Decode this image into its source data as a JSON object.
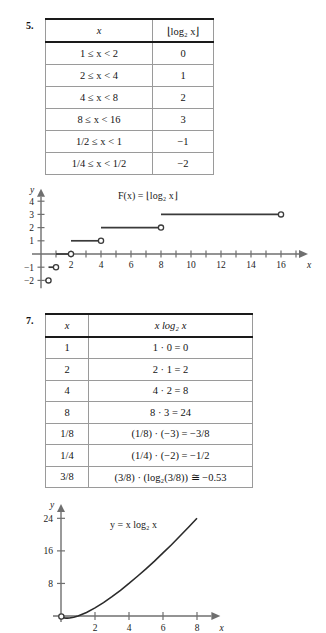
{
  "page": {
    "background": "#ffffff",
    "ink": "#1a1a1a"
  },
  "exercise5": {
    "number": "5.",
    "table": {
      "headers": [
        "x",
        "⌊log₂ x⌋"
      ],
      "rows": [
        [
          "1 ≤ x < 2",
          "0"
        ],
        [
          "2 ≤ x < 4",
          "1"
        ],
        [
          "4 ≤ x < 8",
          "2"
        ],
        [
          "8 ≤ x < 16",
          "3"
        ],
        [
          "1/2 ≤ x < 1",
          "−1"
        ],
        [
          "1/4 ≤ x < 1/2",
          "−2"
        ]
      ]
    },
    "chart_data": {
      "type": "line",
      "title": "",
      "annotation": "F(x) = ⌊log₂ x⌋",
      "xlabel": "x",
      "ylabel": "y",
      "xlim": [
        -0.6,
        17.6
      ],
      "ylim": [
        -2.6,
        4.8
      ],
      "xticks": [
        1,
        2,
        3,
        4,
        5,
        6,
        7,
        8,
        9,
        10,
        11,
        12,
        13,
        14,
        15,
        16,
        17
      ],
      "xtick_labels": [
        {
          "x": 2,
          "label": "2"
        },
        {
          "x": 4,
          "label": "4"
        },
        {
          "x": 6,
          "label": "6"
        },
        {
          "x": 8,
          "label": "8"
        },
        {
          "x": 10,
          "label": "10"
        },
        {
          "x": 12,
          "label": "12"
        },
        {
          "x": 14,
          "label": "14"
        },
        {
          "x": 16,
          "label": "16"
        }
      ],
      "yticks": [
        -2,
        -1,
        1,
        2,
        3,
        4
      ],
      "ytick_labels": [
        "−2",
        "−1",
        "1",
        "2",
        "3",
        "4"
      ],
      "grid": false,
      "legend": false,
      "steps": [
        {
          "x_start": 0.25,
          "x_end": 0.5,
          "y": -2,
          "open_right": true,
          "open_left": false
        },
        {
          "x_start": 0.5,
          "x_end": 1.0,
          "y": -1,
          "open_right": true,
          "open_left": false
        },
        {
          "x_start": 1.0,
          "x_end": 2.0,
          "y": 0,
          "open_right": true,
          "open_left": false
        },
        {
          "x_start": 2.0,
          "x_end": 4.0,
          "y": 1,
          "open_right": true,
          "open_left": false
        },
        {
          "x_start": 4.0,
          "x_end": 8.0,
          "y": 2,
          "open_right": true,
          "open_left": false
        },
        {
          "x_start": 8.0,
          "x_end": 16.0,
          "y": 3,
          "open_right": true,
          "open_left": false
        }
      ]
    }
  },
  "exercise7": {
    "number": "7.",
    "table": {
      "headers": [
        "x",
        "x log₂ x"
      ],
      "rows": [
        [
          "1",
          "1 · 0 = 0"
        ],
        [
          "2",
          "2 · 1 = 2"
        ],
        [
          "4",
          "4 · 2 = 8"
        ],
        [
          "8",
          "8 · 3 = 24"
        ],
        [
          "1/8",
          "(1/8) · (−3) = −3/8"
        ],
        [
          "1/4",
          "(1/4) · (−2) = −1/2"
        ],
        [
          "3/8",
          "(3/8) · (log₂(3/8)) ≅ −0.53"
        ]
      ]
    },
    "chart_data": {
      "type": "line",
      "title": "",
      "annotation": "y = x log₂ x",
      "xlabel": "x",
      "ylabel": "y",
      "xlim": [
        -0.4,
        9.2
      ],
      "ylim": [
        -1.5,
        27
      ],
      "xtick_labels": [
        {
          "x": 2,
          "label": "2"
        },
        {
          "x": 4,
          "label": "4"
        },
        {
          "x": 6,
          "label": "6"
        },
        {
          "x": 8,
          "label": "8"
        }
      ],
      "yticks": [
        8,
        16,
        24
      ],
      "ytick_labels": [
        "8",
        "16",
        "24"
      ],
      "grid": false,
      "legend": false,
      "series": [
        {
          "name": "y = x log2 x",
          "x": [
            0.02,
            0.1,
            0.2,
            0.3,
            0.368,
            0.5,
            0.75,
            1.0,
            1.5,
            2.0,
            2.5,
            3.0,
            3.5,
            4.0,
            4.5,
            5.0,
            5.5,
            6.0,
            6.5,
            7.0,
            7.5,
            8.0
          ],
          "y": [
            -0.11,
            -0.33,
            -0.46,
            -0.52,
            -0.53,
            -0.5,
            -0.31,
            0.0,
            0.88,
            2.0,
            3.3,
            4.75,
            6.32,
            8.0,
            9.77,
            11.6,
            13.5,
            15.5,
            17.5,
            19.65,
            21.8,
            24.0
          ]
        }
      ]
    }
  }
}
